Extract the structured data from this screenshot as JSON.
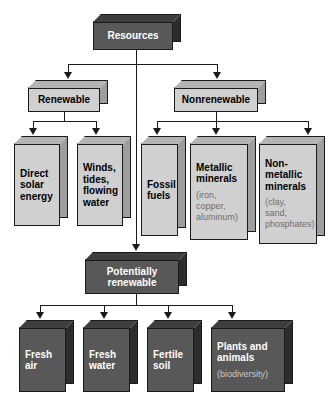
{
  "diagram": {
    "colors": {
      "dark_face": "#585858",
      "light_face": "#d0d0d0",
      "line": "#1a1a1a",
      "dark_text": "#ffffff",
      "light_text": "#000000",
      "sub_text_light": "#6e6e6e",
      "sub_text_dark": "#c8c8c8"
    },
    "nodes": {
      "root": {
        "label": "Resources"
      },
      "renewable": {
        "label": "Renewable"
      },
      "nonrenewable": {
        "label": "Nonrenewable"
      },
      "direct_solar": {
        "label": "Direct\nsolar\nenergy"
      },
      "winds": {
        "label": "Winds,\ntides,\nflowing\nwater"
      },
      "fossil_fuels": {
        "label": "Fossil\nfuels"
      },
      "metallic": {
        "label": "Metallic\nminerals",
        "sub": "(iron,\ncopper,\naluminum)"
      },
      "nonmetallic": {
        "label": "Non-\nmetallic\nminerals",
        "sub": "(clay,\nsand,\nphosphates)"
      },
      "potentially_renewable": {
        "label": "Potentially\nrenewable"
      },
      "fresh_air": {
        "label": "Fresh\nair"
      },
      "fresh_water": {
        "label": "Fresh\nwater"
      },
      "fertile_soil": {
        "label": "Fertile\nsoil"
      },
      "plants_animals": {
        "label": "Plants and\nanimals",
        "sub": "(biodiversity)"
      }
    }
  }
}
